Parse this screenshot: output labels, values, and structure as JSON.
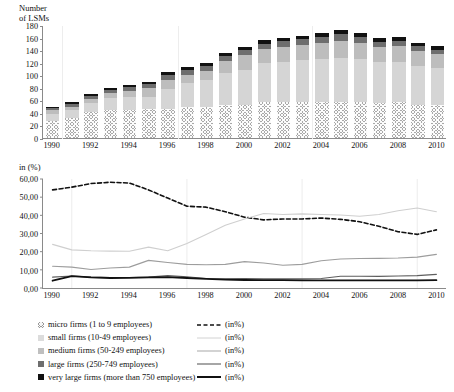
{
  "chart_data": [
    {
      "type": "bar",
      "stacked": true,
      "title": "Number of LSMs",
      "ylabel": "Number of LSMs",
      "xlabel": "",
      "ylim": [
        0,
        180
      ],
      "ytick_step": 20,
      "yticks": [
        "0",
        "20",
        "40",
        "60",
        "80",
        "100",
        "120",
        "140",
        "160",
        "180"
      ],
      "grid": false,
      "legend_position": "bottom",
      "categories": [
        1990,
        1991,
        1992,
        1993,
        1994,
        1995,
        1996,
        1997,
        1998,
        1999,
        2000,
        2001,
        2002,
        2003,
        2004,
        2005,
        2006,
        2007,
        2008,
        2009,
        2010
      ],
      "xtick_labels": [
        "1990",
        "1992",
        "1994",
        "1996",
        "1998",
        "2000",
        "2002",
        "2004",
        "2006",
        "2008",
        "2010"
      ],
      "series": [
        {
          "name": "micro firms (1 to 9 employees)",
          "values": [
            27,
            32,
            41,
            45,
            45,
            46,
            46,
            50,
            49,
            52,
            52,
            57,
            57,
            57,
            58,
            58,
            57,
            56,
            57,
            53,
            52
          ]
        },
        {
          "name": "small firms (10-49 employees)",
          "values": [
            12,
            12,
            14,
            18,
            20,
            20,
            32,
            37,
            44,
            52,
            57,
            62,
            64,
            67,
            68,
            70,
            69,
            65,
            64,
            62,
            60
          ]
        },
        {
          "name": "medium firms (50-249 employees)",
          "values": [
            6,
            6,
            7,
            8,
            10,
            13,
            15,
            14,
            14,
            19,
            23,
            23,
            24,
            24,
            26,
            27,
            26,
            24,
            25,
            24,
            22
          ]
        },
        {
          "name": "large firms (250-749 employees)",
          "values": [
            3,
            5,
            5,
            5,
            6,
            7,
            8,
            7,
            7,
            8,
            8,
            8,
            9,
            9,
            9,
            10,
            9,
            8,
            9,
            8,
            7
          ]
        },
        {
          "name": "very large firms (more than 750 employees)",
          "values": [
            2,
            3,
            3,
            3,
            4,
            4,
            5,
            5,
            5,
            5,
            5,
            6,
            6,
            6,
            6,
            7,
            6,
            6,
            6,
            5,
            5
          ]
        }
      ]
    },
    {
      "type": "line",
      "title": "in (%)",
      "ylabel": "in (%)",
      "xlabel": "",
      "ylim": [
        0,
        60
      ],
      "ytick_step": 10,
      "yticks": [
        "0,00",
        "10,00",
        "20,00",
        "30,00",
        "40,00",
        "50,00",
        "60,00"
      ],
      "grid": false,
      "legend_position": "bottom",
      "x": [
        1990,
        1991,
        1992,
        1993,
        1994,
        1995,
        1996,
        1997,
        1998,
        1999,
        2000,
        2001,
        2002,
        2003,
        2004,
        2005,
        2006,
        2007,
        2008,
        2009,
        2010
      ],
      "xtick_labels": [
        "1990",
        "1992",
        "1994",
        "1996",
        "1998",
        "2000",
        "2002",
        "2004",
        "2006",
        "2008",
        "2010"
      ],
      "series": [
        {
          "name": "micro firms (1 to 9 employees) (in%)",
          "style": "dashed",
          "color": "#111111",
          "width": 1.6,
          "values": [
            54.0,
            55.5,
            57.5,
            58.2,
            57.8,
            54.0,
            49.5,
            45.0,
            44.5,
            42.0,
            39.0,
            37.5,
            38.0,
            38.0,
            38.5,
            37.8,
            36.5,
            34.0,
            31.0,
            29.5,
            32.0
          ]
        },
        {
          "name": "small firms (10-49 employees) (in%)",
          "style": "solid",
          "color": "#cfcfcf",
          "width": 1.1,
          "values": [
            24.0,
            21.0,
            20.5,
            20.3,
            20.2,
            22.5,
            20.5,
            24.5,
            29.5,
            34.5,
            38.0,
            41.0,
            40.5,
            40.8,
            40.5,
            40.2,
            39.5,
            40.5,
            42.5,
            44.0,
            42.0
          ]
        },
        {
          "name": "medium firms (50-249 employees) (in%)",
          "style": "solid",
          "color": "#9d9d9d",
          "width": 1.1,
          "values": [
            12.0,
            11.5,
            10.2,
            11.0,
            11.5,
            15.2,
            14.0,
            13.0,
            12.8,
            13.0,
            14.5,
            13.8,
            12.5,
            13.0,
            15.0,
            16.0,
            16.2,
            16.3,
            16.5,
            17.0,
            18.5
          ]
        },
        {
          "name": "large firms (250-749 employees) (in%)",
          "style": "solid",
          "color": "#5e5e5e",
          "width": 1.1,
          "values": [
            6.0,
            6.6,
            6.0,
            5.8,
            5.8,
            6.0,
            6.8,
            6.2,
            5.2,
            5.0,
            5.2,
            5.0,
            5.0,
            5.0,
            5.2,
            6.5,
            6.5,
            6.4,
            6.6,
            6.8,
            7.5
          ]
        },
        {
          "name": "very large firms (more than 750 employees) (in%)",
          "style": "solid",
          "color": "#111111",
          "width": 1.8,
          "values": [
            4.0,
            6.5,
            5.8,
            5.5,
            5.6,
            5.8,
            6.0,
            5.5,
            5.0,
            4.6,
            4.4,
            4.3,
            4.3,
            4.2,
            4.2,
            4.2,
            4.2,
            4.2,
            4.2,
            4.2,
            4.3
          ]
        }
      ]
    }
  ],
  "top_chart": {
    "axis_title": "Number\nof LSMs"
  },
  "bottom_chart": {
    "axis_title": "in (%)"
  },
  "legend": {
    "rows": [
      {
        "swatch": "hatched-square-icon",
        "label": "micro firms (1 to 9 employees)",
        "line": "dashed-line-icon",
        "pct": "(in%)"
      },
      {
        "swatch": "light-gray-square-icon",
        "label": "small firms (10-49 employees)",
        "line": "light-line-icon",
        "pct": "(in%)"
      },
      {
        "swatch": "medium-gray-square-icon",
        "label": "medium firms (50-249 employees)",
        "line": "medium-line-icon",
        "pct": "(in%)"
      },
      {
        "swatch": "dark-gray-square-icon",
        "label": "large firms (250-749 employees)",
        "line": "dark-line-icon",
        "pct": "(in%)"
      },
      {
        "swatch": "black-square-icon",
        "label": "very large firms (more than 750 employees)",
        "line": "thick-black-line-icon",
        "pct": "(in%)"
      }
    ]
  }
}
